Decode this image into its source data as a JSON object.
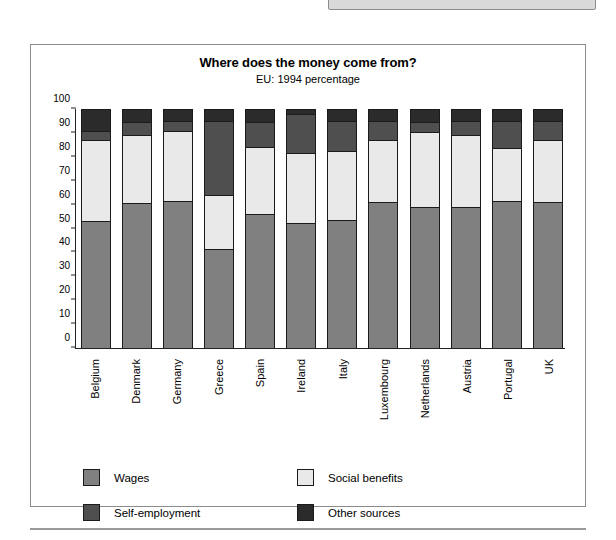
{
  "page": {
    "top_panel_name": "clipped-gray-panel",
    "rule_name": "page-divider-rule"
  },
  "chart_data": {
    "type": "bar",
    "stacked": true,
    "title": "Where does the money come from?",
    "subtitle": "EU: 1994 percentage",
    "xlabel": "",
    "ylabel": "",
    "ylim": [
      0,
      100
    ],
    "ytick_step": 10,
    "yticks": [
      0,
      10,
      20,
      30,
      40,
      50,
      60,
      70,
      80,
      90,
      100
    ],
    "grid": false,
    "legend_position": "bottom",
    "categories": [
      "Belgium",
      "Denmark",
      "Germany",
      "Greece",
      "Spain",
      "Ireland",
      "Italy",
      "Luxembourg",
      "Netherlands",
      "Austria",
      "Portugal",
      "UK"
    ],
    "series": [
      {
        "name": "Wages",
        "color": "#808080",
        "values": [
          53,
          60.5,
          61.5,
          41.5,
          56,
          52.5,
          53.5,
          61,
          59,
          59,
          61.5,
          61
        ]
      },
      {
        "name": "Social benefits",
        "color": "#e9e9e9",
        "values": [
          34,
          28.5,
          29.5,
          22.5,
          28,
          29,
          29,
          26,
          31.5,
          30,
          22,
          26
        ]
      },
      {
        "name": "Self-employment",
        "color": "#4f4f4f",
        "values": [
          4,
          5.5,
          4,
          31,
          10.5,
          16.5,
          12.5,
          8,
          4,
          6,
          11.5,
          8
        ]
      },
      {
        "name": "Other sources",
        "color": "#2b2b2b",
        "values": [
          9,
          5.5,
          5,
          5,
          5.5,
          2,
          5,
          5,
          5.5,
          5,
          5,
          5
        ]
      }
    ]
  },
  "legend": {
    "items": [
      {
        "label": "Wages",
        "color": "#808080",
        "icon": "legend-swatch-icon"
      },
      {
        "label": "Social benefits",
        "color": "#e9e9e9",
        "icon": "legend-swatch-icon"
      },
      {
        "label": "Self-employment",
        "color": "#4f4f4f",
        "icon": "legend-swatch-icon"
      },
      {
        "label": "Other sources",
        "color": "#2b2b2b",
        "icon": "legend-swatch-icon"
      }
    ]
  }
}
